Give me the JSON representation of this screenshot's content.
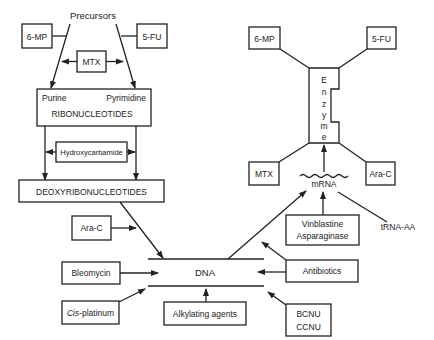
{
  "left_pathway": {
    "precursors": "Precursors",
    "inhibitor_6mp": "6-MP",
    "inhibitor_5fu": "5-FU",
    "inhibitor_mtx": "MTX",
    "ribonucleotides": {
      "purine": "Purine",
      "pyrimidine": "Pyrimidine",
      "label": "RIBONUCLEOTIDES"
    },
    "hydroxycarbamide": "Hydroxycarbamide",
    "deoxyribonucleotides": "DEOXYRIBONUCLEOTIDES"
  },
  "dna_section": {
    "dna": "DNA",
    "ara_c": "Ara-C",
    "bleomycin": "Bleomycin",
    "cis_platinum_italic": "Cis",
    "cis_platinum_rest": "-platinum",
    "alkylating_agents": "Alkylating agents",
    "antibiotics": "Antibiotics",
    "bcnu": "BCNU",
    "ccnu": "CCNU"
  },
  "right_pathway": {
    "enzyme_letters": [
      "E",
      "n",
      "z",
      "y",
      "m",
      "e"
    ],
    "inhibitor_6mp": "6-MP",
    "inhibitor_5fu": "5-FU",
    "inhibitor_mtx": "MTX",
    "inhibitor_arac": "Ara-C",
    "mrna": "mRNA",
    "vinblastine": "Vinblastine",
    "asparaginase": "Asparaginase",
    "trna": "tRNA-AA"
  }
}
